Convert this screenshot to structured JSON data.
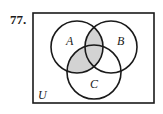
{
  "problem_number": "77.",
  "universe_label": "U",
  "sets": [
    {
      "label": "A",
      "cx": 77,
      "cy": 47,
      "r": 26
    },
    {
      "label": "B",
      "cx": 111,
      "cy": 47,
      "r": 26
    },
    {
      "label": "C",
      "cx": 94,
      "cy": 72,
      "r": 27
    }
  ],
  "shaded_region": "A ∩ (B ∪ C)",
  "colors": {
    "shade": "#d3d3d3",
    "stroke": "#1a1a1a"
  }
}
